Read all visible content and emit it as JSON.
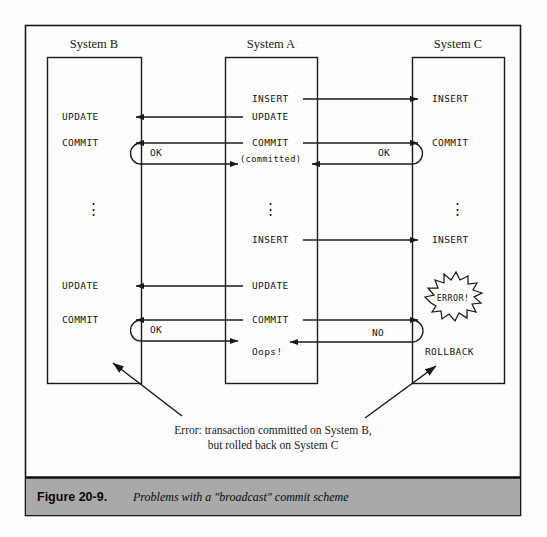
{
  "figure": {
    "caption_number": "Figure 20-9.",
    "caption_description": "Problems with a \"broadcast\" commit scheme",
    "caption_bar_color": "#a9a9a9",
    "frame_color": "#1a1a1a",
    "background_color": "#fdfdfb"
  },
  "annotation": {
    "line1": "Error: transaction committed on System B,",
    "line2": "but rolled back on System C"
  },
  "columns": [
    {
      "id": "system-b",
      "title": "System B",
      "steps": [
        {
          "label": "UPDATE",
          "y": 117
        },
        {
          "label": "COMMIT",
          "y": 143
        },
        {
          "label": "⋮",
          "y": 208
        },
        {
          "label": "UPDATE",
          "y": 286
        },
        {
          "label": "COMMIT",
          "y": 320
        }
      ]
    },
    {
      "id": "system-a",
      "title": "System A",
      "steps": [
        {
          "label": "INSERT",
          "y": 99
        },
        {
          "label": "UPDATE",
          "y": 117
        },
        {
          "label": "COMMIT",
          "y": 143
        },
        {
          "label": "(committed)",
          "y": 159
        },
        {
          "label": "⋮",
          "y": 208
        },
        {
          "label": "INSERT",
          "y": 240
        },
        {
          "label": "UPDATE",
          "y": 286
        },
        {
          "label": "COMMIT",
          "y": 320
        },
        {
          "label": "Oops!",
          "y": 352
        }
      ]
    },
    {
      "id": "system-c",
      "title": "System C",
      "steps": [
        {
          "label": "INSERT",
          "y": 99
        },
        {
          "label": "COMMIT",
          "y": 143
        },
        {
          "label": "⋮",
          "y": 208
        },
        {
          "label": "INSERT",
          "y": 240
        },
        {
          "label": "ROLLBACK",
          "y": 352
        }
      ]
    }
  ],
  "reply_labels": {
    "ok_left_upper": "OK",
    "ok_right_upper": "OK",
    "ok_left_lower": "OK",
    "no_right_lower": "NO"
  },
  "burst": {
    "label": "ERROR!"
  }
}
